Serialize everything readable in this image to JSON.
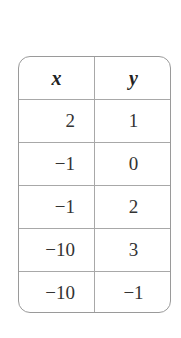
{
  "table": {
    "headers": [
      "x",
      "y"
    ],
    "rows": [
      {
        "x": "2",
        "y": "1"
      },
      {
        "x": "−1",
        "y": "0"
      },
      {
        "x": "−1",
        "y": "2"
      },
      {
        "x": "−10",
        "y": "3"
      },
      {
        "x": "−10",
        "y": "−1"
      }
    ]
  }
}
